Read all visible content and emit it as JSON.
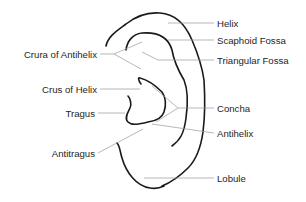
{
  "diagram": {
    "labels_left": [
      {
        "id": "crura-of-antihelix",
        "text": "Crura of Antihelix"
      },
      {
        "id": "crus-of-helix",
        "text": "Crus of Helix"
      },
      {
        "id": "tragus",
        "text": "Tragus"
      },
      {
        "id": "antitragus",
        "text": "Antitragus"
      }
    ],
    "labels_right": [
      {
        "id": "helix",
        "text": "Helix"
      },
      {
        "id": "scaphoid-fossa",
        "text": "Scaphoid Fossa"
      },
      {
        "id": "triangular-fossa",
        "text": "Triangular Fossa"
      },
      {
        "id": "concha",
        "text": "Concha"
      },
      {
        "id": "antihelix",
        "text": "Antihelix"
      },
      {
        "id": "lobule",
        "text": "Lobule"
      }
    ],
    "colors": {
      "outline": "#1a1a1a",
      "leader": "#9a9a9a",
      "text": "#1e1e1e",
      "background": "#ffffff"
    }
  }
}
